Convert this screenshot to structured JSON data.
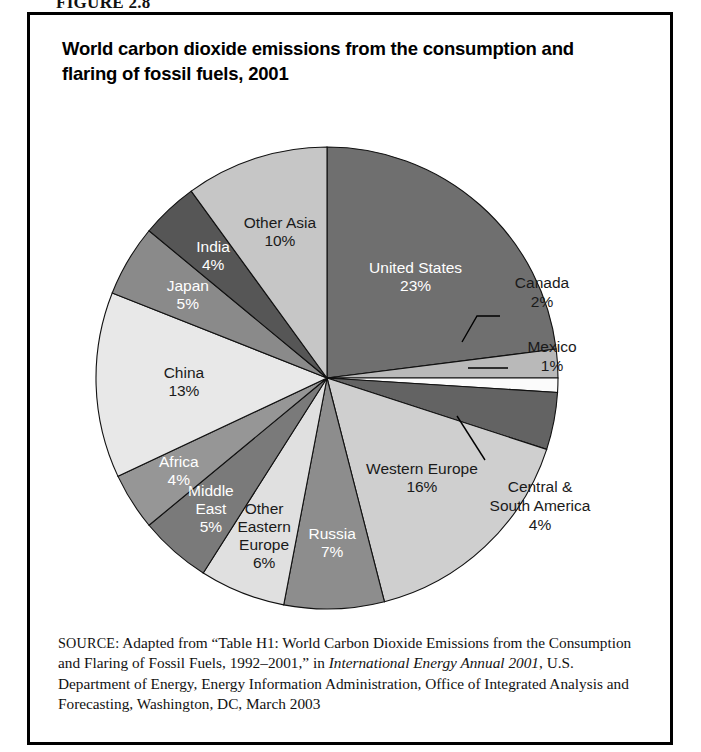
{
  "figure": {
    "label": "FIGURE 2.8"
  },
  "chart_title": "World carbon dioxide emissions from the consumption and flaring of fossil fuels, 2001",
  "source": {
    "prefix": "SOURCE:",
    "line_a": " Adapted from “Table H1: World Carbon Dioxide Emissions from the Consumption and Flaring of Fossil Fuels, 1992–2001,” in ",
    "italic_title": "International Energy Annual 2001",
    "line_b": ", U.S. Department of Energy, Energy Information Administration, Office of Integrated Analysis and Forecasting, Washington, DC, March 2003"
  },
  "chart_data": {
    "type": "pie",
    "title": "World carbon dioxide emissions from the consumption and flaring of fossil fuels, 2001",
    "unit": "percent",
    "total": 100,
    "start_angle_deg": 0,
    "direction": "clockwise",
    "legend": "none",
    "labels_inside_slices": true,
    "slices": [
      {
        "name": "United States",
        "value": 23,
        "value_label": "23%",
        "color": "#6f6f6f",
        "text_color": "light",
        "label_mode": "inside",
        "label_r": 0.58,
        "lines": [
          "United States",
          "23%"
        ]
      },
      {
        "name": "Canada",
        "value": 2,
        "value_label": "2%",
        "color": "#b9b9b9",
        "text_color": "dark",
        "label_mode": "callout",
        "lines": [
          "Canada",
          "2%"
        ]
      },
      {
        "name": "Mexico",
        "value": 1,
        "value_label": "1%",
        "color": "#fbfbfb",
        "text_color": "dark",
        "label_mode": "callout",
        "lines": [
          "Mexico",
          "1%"
        ]
      },
      {
        "name": "Central & South America",
        "value": 4,
        "value_label": "4%",
        "color": "#636363",
        "text_color": "dark",
        "label_mode": "callout",
        "lines": [
          "Central &",
          "South America",
          "4%"
        ]
      },
      {
        "name": "Western Europe",
        "value": 16,
        "value_label": "16%",
        "color": "#cfcfcf",
        "text_color": "dark",
        "label_mode": "inside",
        "label_r": 0.6,
        "lines": [
          "Western Europe",
          "16%"
        ]
      },
      {
        "name": "Russia",
        "value": 7,
        "value_label": "7%",
        "color": "#8d8d8d",
        "text_color": "light",
        "label_mode": "inside",
        "label_r": 0.72,
        "lines": [
          "Russia",
          "7%"
        ]
      },
      {
        "name": "Other Eastern Europe",
        "value": 6,
        "value_label": "6%",
        "color": "#e0e0e0",
        "text_color": "dark",
        "label_mode": "inside",
        "label_r": 0.74,
        "lines": [
          "Other",
          "Eastern",
          "Europe",
          "6%"
        ]
      },
      {
        "name": "Middle East",
        "value": 5,
        "value_label": "5%",
        "color": "#7a7a7a",
        "text_color": "light",
        "label_mode": "inside",
        "label_r": 0.76,
        "lines": [
          "Middle",
          "East",
          "5%"
        ]
      },
      {
        "name": "Africa",
        "value": 4,
        "value_label": "4%",
        "color": "#969696",
        "text_color": "light",
        "label_mode": "inside",
        "label_r": 0.76,
        "lines": [
          "Africa",
          "4%"
        ]
      },
      {
        "name": "China",
        "value": 13,
        "value_label": "13%",
        "color": "#e8e8e8",
        "text_color": "dark",
        "label_mode": "inside",
        "label_r": 0.62,
        "lines": [
          "China",
          "13%"
        ]
      },
      {
        "name": "Japan",
        "value": 5,
        "value_label": "5%",
        "color": "#8a8a8a",
        "text_color": "light",
        "label_mode": "inside",
        "label_r": 0.7,
        "lines": [
          "Japan",
          "5%"
        ]
      },
      {
        "name": "India",
        "value": 4,
        "value_label": "4%",
        "color": "#565656",
        "text_color": "light",
        "label_mode": "inside",
        "label_r": 0.72,
        "lines": [
          "India",
          "4%"
        ]
      },
      {
        "name": "Other Asia",
        "value": 10,
        "value_label": "10%",
        "color": "#c6c6c6",
        "text_color": "dark",
        "label_mode": "inside",
        "label_r": 0.66,
        "lines": [
          "Other Asia",
          "10%"
        ]
      }
    ],
    "callouts": [
      {
        "name": "Canada",
        "text_x": 512,
        "text_y": 168,
        "elbow": [
          [
            432,
            222
          ],
          [
            447,
            196
          ],
          [
            470,
            196
          ]
        ]
      },
      {
        "name": "Mexico",
        "text_x": 522,
        "text_y": 232,
        "elbow": [
          [
            438,
            248
          ],
          [
            478,
            248
          ]
        ]
      },
      {
        "name": "Central & South America",
        "text_x": 510,
        "text_y": 372,
        "elbow": [
          [
            427,
            296
          ],
          [
            455,
            340
          ]
        ]
      }
    ]
  }
}
